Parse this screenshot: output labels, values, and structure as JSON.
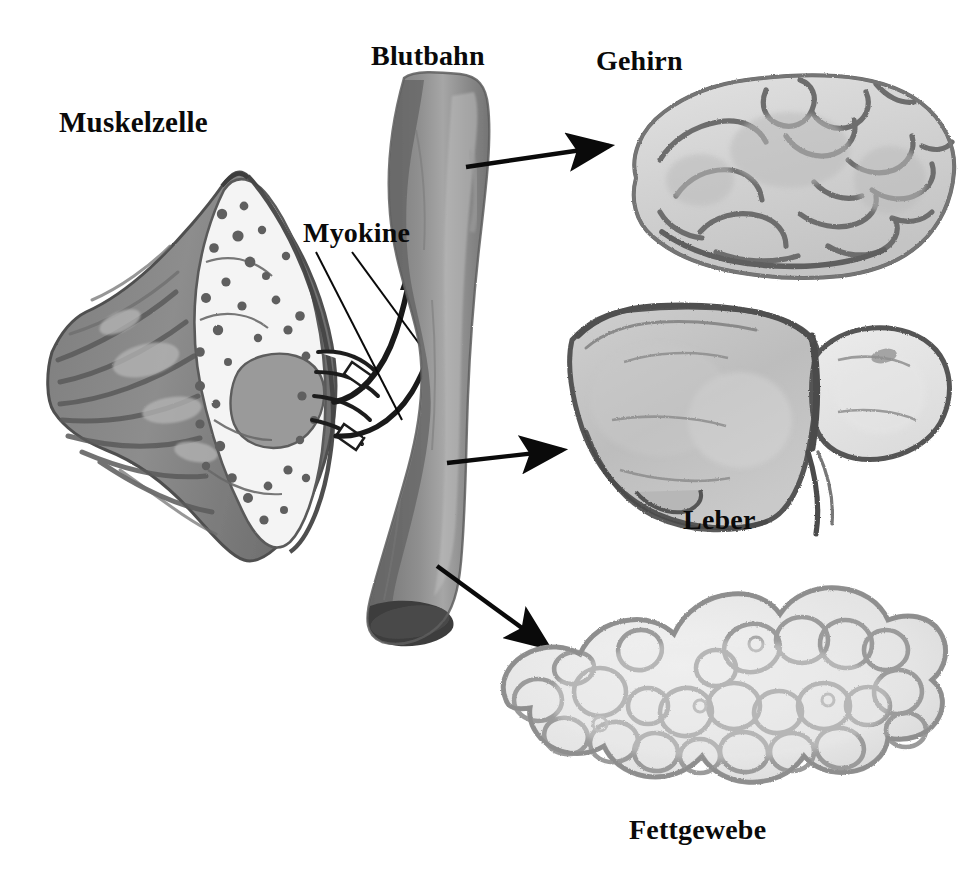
{
  "figure": {
    "kind": "hand-drawn scientific illustration",
    "language": "German",
    "background_color": "#ffffff",
    "ink_color": "#0a0a0a"
  },
  "labels": {
    "muscle_cell": "Muskelzelle",
    "bloodstream": "Blutbahn",
    "myokines": "Myokine",
    "brain": "Gehirn",
    "liver": "Leber",
    "adipose": "Fettgewebe"
  },
  "icons": {
    "muscle_cell": "muscle-cell-icon",
    "blood_vessel": "blood-vessel-icon",
    "brain": "brain-icon",
    "liver": "liver-icon",
    "adipose": "adipose-tissue-icon",
    "arrow": "arrow-icon",
    "leader_line": "leader-line-icon",
    "myokine_tube": "myokine-tube-icon"
  },
  "colors": {
    "wash_dark": "#6e6e6e",
    "wash_mid": "#8f8f8f",
    "wash_light": "#b9b9b9",
    "wash_pale": "#d8d8d8",
    "wash_faint": "#ebebeb",
    "outline": "#5a5a5a",
    "outline_dark": "#2a2a2a",
    "vessel_body": "#8d8d8d",
    "vessel_shadow": "#6a6a6a",
    "vessel_highlight": "#a8a8a8",
    "vessel_lumen": "#4a4a4a",
    "arrow_black": "#0a0a0a"
  },
  "arrows": [
    {
      "name": "arrow-to-brain",
      "from": "blood-vessel",
      "to": "brain",
      "x1": 466,
      "y1": 167,
      "x2": 617,
      "y2": 145
    },
    {
      "name": "arrow-to-liver",
      "from": "blood-vessel",
      "to": "liver",
      "x1": 447,
      "y1": 463,
      "x2": 570,
      "y2": 449
    },
    {
      "name": "arrow-to-adipose",
      "from": "blood-vessel",
      "to": "adipose-tissue",
      "x1": 437,
      "y1": 566,
      "x2": 556,
      "y2": 654
    }
  ],
  "myokine_arrows": [
    {
      "name": "myokine-arrow-upper",
      "curve": "muscle cell to vessel, curving up-right"
    },
    {
      "name": "myokine-arrow-lower",
      "curve": "muscle cell to vessel, curving up-right"
    }
  ],
  "leader_lines": [
    {
      "name": "myokine-leader-1",
      "x1": 318,
      "y1": 252,
      "x2": 400,
      "y2": 418
    },
    {
      "name": "myokine-leader-2",
      "x1": 352,
      "y1": 252,
      "x2": 438,
      "y2": 370
    }
  ],
  "organs": [
    {
      "name": "brain-icon",
      "label": "Gehirn",
      "bbox": [
        604,
        62,
        960,
        270
      ]
    },
    {
      "name": "liver-icon",
      "label": "Leber",
      "bbox": [
        560,
        305,
        945,
        545
      ]
    },
    {
      "name": "adipose-tissue-icon",
      "label": "Fettgewebe",
      "bbox": [
        490,
        590,
        945,
        800
      ]
    },
    {
      "name": "muscle-cell-icon",
      "label": "Muskelzelle",
      "bbox": [
        50,
        170,
        360,
        560
      ]
    },
    {
      "name": "blood-vessel-icon",
      "label": "Blutbahn",
      "bbox": [
        355,
        75,
        500,
        650
      ]
    }
  ]
}
